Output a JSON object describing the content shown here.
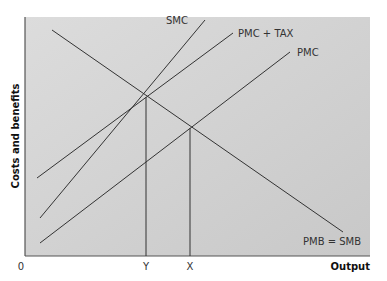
{
  "chart_data": {
    "type": "line",
    "title": "",
    "xlabel": "Output",
    "ylabel": "Costs and benefits",
    "origin_label": "0",
    "grid": false,
    "legend": "inline labels at line ends",
    "background": "#d4d4d4",
    "x_ticks": [
      {
        "label": "Y",
        "px": 146
      },
      {
        "label": "X",
        "px": 190
      }
    ],
    "series": [
      {
        "name": "SMC",
        "label": "SMC",
        "points": [
          [
            40,
            218
          ],
          [
            205,
            20
          ]
        ],
        "label_pos": [
          166,
          24
        ]
      },
      {
        "name": "PMC + TAX",
        "label": "PMC + TAX",
        "points": [
          [
            37,
            178
          ],
          [
            233,
            33
          ]
        ],
        "label_pos": [
          238,
          37
        ]
      },
      {
        "name": "PMC",
        "label": "PMC",
        "points": [
          [
            40,
            243
          ],
          [
            290,
            52
          ]
        ],
        "label_pos": [
          297,
          56
        ]
      },
      {
        "name": "PMB = SMB",
        "label": "PMB = SMB",
        "points": [
          [
            52,
            30
          ],
          [
            343,
            232
          ]
        ],
        "label_pos": [
          303,
          245
        ]
      }
    ],
    "intersections": [
      {
        "name": "SMC/PMC+TAX with PMB",
        "at": "Y",
        "px": [
          146,
          97
        ]
      },
      {
        "name": "PMC with PMB",
        "at": "X",
        "px": [
          190,
          128
        ]
      }
    ],
    "plot_area_px": {
      "left": 25,
      "top": 17,
      "right": 370,
      "bottom": 256
    }
  }
}
